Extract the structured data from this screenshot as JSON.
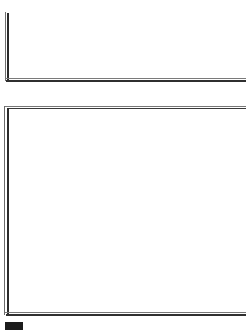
{
  "page": {
    "width": 246,
    "height": 332,
    "background_color": "#ffffff",
    "content_text": ""
  },
  "colors": {
    "page_background": "#ffffff",
    "rule_dark": "#2b2b2b",
    "rule_light": "#777777",
    "marker_fill": "#1c1c1c"
  },
  "frame_top": {
    "name": "upper-open-frame",
    "vertical_rule_label": "",
    "horizontal_rule_label": "",
    "body_text": ""
  },
  "frame_main": {
    "name": "lower-rectangle-frame",
    "top_rule_label": "",
    "left_rule_label": "",
    "bottom_rule_label": "",
    "body_text": ""
  },
  "marker": {
    "label": "",
    "fill": "#1c1c1c"
  }
}
